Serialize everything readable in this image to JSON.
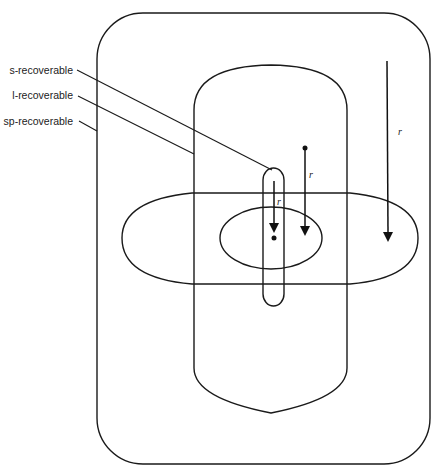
{
  "diagram": {
    "labels": {
      "s_recoverable": "s-recoverable",
      "l_recoverable": "l-recoverable",
      "sp_recoverable": "sp-recoverable"
    },
    "arrows": {
      "outer": {
        "label": "r"
      },
      "middle": {
        "label": "r"
      },
      "inner": {
        "label": "r"
      }
    },
    "colors": {
      "stroke": "#1a1a1a",
      "background": "#ffffff"
    }
  }
}
